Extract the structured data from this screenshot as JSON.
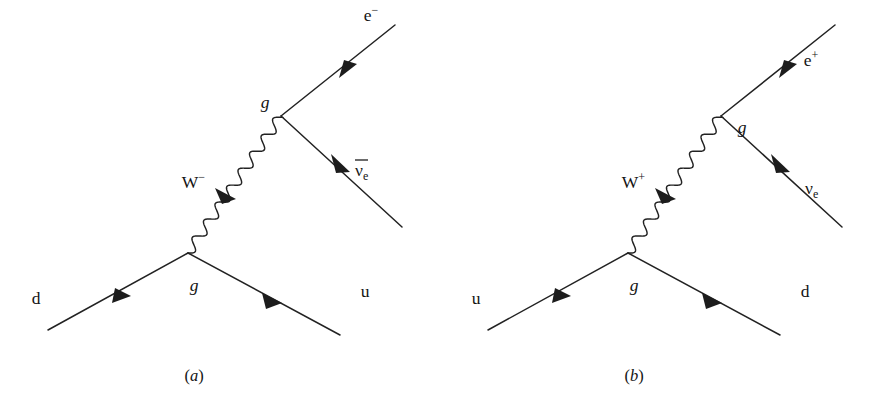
{
  "figure": {
    "background_color": "#ffffff",
    "line_color": "#222222",
    "text_color": "#141414",
    "panels": [
      {
        "id": "panel-a",
        "caption_prefix": "(",
        "caption_letter": "a",
        "caption_suffix": ")",
        "process": "d → u + W⁻, W⁻ → e⁻ + ν̄e",
        "incoming_fermion": "d",
        "outgoing_fermion": "u",
        "boson_base": "W",
        "boson_charge": "−",
        "lepton_base": "e",
        "lepton_charge": "−",
        "neutrino_glyph": "ν",
        "neutrino_subscript": "e",
        "neutrino_has_overbar": true,
        "lower_vertex_label": "g",
        "upper_vertex_label": "g",
        "upper_vertex_label_side": "left"
      },
      {
        "id": "panel-b",
        "caption_prefix": "(",
        "caption_letter": "b",
        "caption_suffix": ")",
        "process": "u → d + W⁺, W⁺ → e⁺ + νe",
        "incoming_fermion": "u",
        "outgoing_fermion": "d",
        "boson_base": "W",
        "boson_charge": "+",
        "lepton_base": "e",
        "lepton_charge": "+",
        "neutrino_glyph": "ν",
        "neutrino_subscript": "e",
        "neutrino_has_overbar": false,
        "lower_vertex_label": "g",
        "upper_vertex_label": "g",
        "upper_vertex_label_side": "right"
      }
    ]
  }
}
